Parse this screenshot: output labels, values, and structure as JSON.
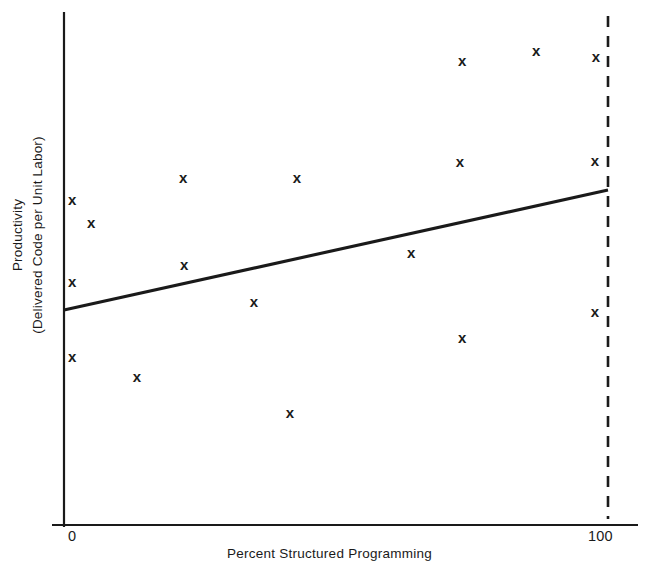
{
  "chart_data": {
    "type": "scatter",
    "title": "",
    "xlabel": "Percent Structured Programming",
    "ylabel_lines": [
      "Productivity",
      "(Delivered Code per Unit Labor)"
    ],
    "ylabel": "Productivity (Delivered Code per Unit Labor)",
    "xlim": [
      0,
      100
    ],
    "ylim": [
      0,
      100
    ],
    "xticks": [
      "0",
      "100"
    ],
    "xtick_values": [
      0,
      100
    ],
    "yticks": [],
    "grid": false,
    "legend": null,
    "marker": "x",
    "marker_color": "#1a1a1a",
    "points": [
      {
        "x": 1.5,
        "y": 63.4
      },
      {
        "x": 5.0,
        "y": 58.9
      },
      {
        "x": 1.5,
        "y": 47.4
      },
      {
        "x": 1.5,
        "y": 32.9
      },
      {
        "x": 13.4,
        "y": 29.0
      },
      {
        "x": 21.9,
        "y": 67.8
      },
      {
        "x": 22.1,
        "y": 50.7
      },
      {
        "x": 34.9,
        "y": 43.5
      },
      {
        "x": 41.5,
        "y": 22.0
      },
      {
        "x": 42.8,
        "y": 67.8
      },
      {
        "x": 63.8,
        "y": 53.2
      },
      {
        "x": 72.8,
        "y": 70.9
      },
      {
        "x": 73.2,
        "y": 90.5
      },
      {
        "x": 73.2,
        "y": 36.6
      },
      {
        "x": 86.8,
        "y": 92.6
      },
      {
        "x": 97.8,
        "y": 91.4
      },
      {
        "x": 97.6,
        "y": 71.1
      },
      {
        "x": 97.6,
        "y": 41.7
      }
    ],
    "trend_line": {
      "label": "regression line",
      "x_start": 0,
      "y_start": 41.9,
      "x_end": 100,
      "y_end": 65.3,
      "style": "solid"
    },
    "reference_line": {
      "label": "100 percent reference",
      "x": 100,
      "orientation": "vertical",
      "style": "dashed"
    }
  }
}
